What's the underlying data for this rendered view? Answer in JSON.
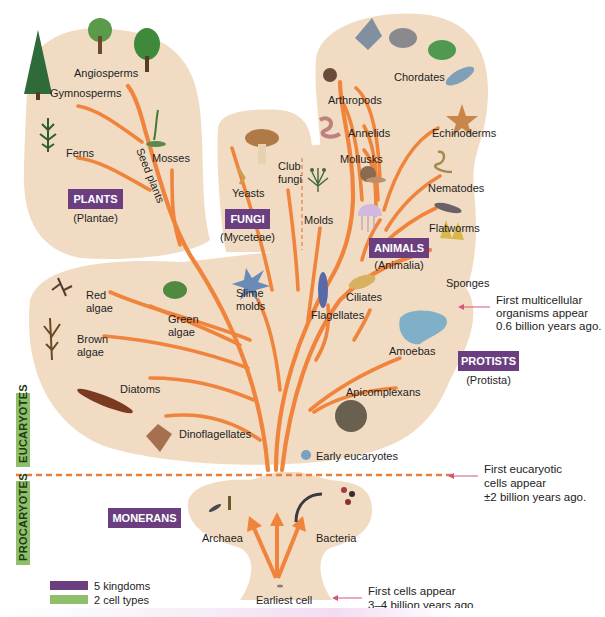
{
  "kingdoms": {
    "plants": {
      "name": "PLANTS",
      "latin": "(Plantae)"
    },
    "fungi": {
      "name": "FUNGI",
      "latin": "(Myceteae)"
    },
    "animals": {
      "name": "ANIMALS",
      "latin": "(Animalia)"
    },
    "protists": {
      "name": "PROTISTS",
      "latin": "(Protista)"
    },
    "monerans": {
      "name": "MONERANS"
    }
  },
  "cell_types": {
    "eucaryotes": "EUCARYOTES",
    "procaryotes": "PROCARYOTES"
  },
  "plants": [
    "Angiosperms",
    "Gymnosperms",
    "Ferns",
    "Mosses",
    "Seed plants"
  ],
  "fungi": [
    "Yeasts",
    "Club",
    "fungi",
    "Molds"
  ],
  "animals": [
    "Chordates",
    "Arthropods",
    "Annelids",
    "Echinoderms",
    "Mollusks",
    "Nematodes",
    "Flatworms",
    "Sponges"
  ],
  "protists": [
    "Red",
    "algae",
    "Green",
    "algae",
    "Slime",
    "molds",
    "Ciliates",
    "Flagellates",
    "Brown",
    "algae",
    "Amoebas",
    "Diatoms",
    "Apicomplexans",
    "Dinoflagellates",
    "Early eucaryotes"
  ],
  "monerans": [
    "Archaea",
    "Bacteria",
    "Earliest cell"
  ],
  "notes": {
    "multicellular": [
      "First multicellular",
      "organisms appear",
      "0.6 billion years ago."
    ],
    "eucaryotic": [
      "First eucaryotic",
      "cells appear",
      "±2 billion years ago."
    ],
    "first_cells": [
      "First  cells appear",
      "3–4 billion years ago."
    ]
  },
  "legend": {
    "items": [
      {
        "label": "5 kingdoms",
        "color": "#6b3f7f"
      },
      {
        "label": "2 cell types",
        "color": "#8fbf6a"
      }
    ]
  },
  "colors": {
    "branch": "#f0843c",
    "region": "#f1dcc3",
    "kingdom_box": "#6b3f7f",
    "cell_type_bar": "#8fbf6a",
    "arrow": "#d2587a"
  }
}
